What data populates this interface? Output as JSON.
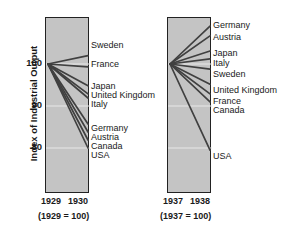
{
  "chart_data": {
    "type": "line",
    "title": "",
    "ylabel": "Index of Industrial Output",
    "xlabel": "",
    "ylim": [
      74,
      112
    ],
    "yticks": [
      100,
      90,
      80
    ],
    "ytick_labels": [
      "100",
      "90",
      "80"
    ],
    "grid": true,
    "legend": "inline-right-labels",
    "panels": [
      {
        "id": "left",
        "x": [
          "1929",
          "1930"
        ],
        "caption": "(1929 = 100)",
        "base_value": 100,
        "series": [
          {
            "name": "Sweden",
            "values": [
              100,
              102.0
            ]
          },
          {
            "name": "France",
            "values": [
              100,
              99.3
            ]
          },
          {
            "name": "Japan",
            "values": [
              100,
              94.8
            ]
          },
          {
            "name": "United Kingdom",
            "values": [
              100,
              92.9
            ]
          },
          {
            "name": "Italy",
            "values": [
              100,
              91.9
            ]
          },
          {
            "name": "Germany",
            "values": [
              100,
              85.7
            ]
          },
          {
            "name": "Austria",
            "values": [
              100,
              83.8
            ]
          },
          {
            "name": "Canada",
            "values": [
              100,
              81.9
            ]
          },
          {
            "name": "USA",
            "values": [
              100,
              80.0
            ]
          }
        ]
      },
      {
        "id": "right",
        "x": [
          "1937",
          "1938"
        ],
        "caption": "(1937 = 100)",
        "base_value": 100,
        "series": [
          {
            "name": "Germany",
            "values": [
              100,
              109.0
            ]
          },
          {
            "name": "Austria",
            "values": [
              100,
              106.7
            ]
          },
          {
            "name": "Japan",
            "values": [
              100,
              103.1
            ]
          },
          {
            "name": "Italy",
            "values": [
              100,
              101.2
            ]
          },
          {
            "name": "Sweden",
            "values": [
              100,
              98.8
            ]
          },
          {
            "name": "United Kingdom",
            "values": [
              100,
              95.2
            ]
          },
          {
            "name": "France",
            "values": [
              100,
              92.9
            ]
          },
          {
            "name": "Canada",
            "values": [
              100,
              91.0
            ]
          },
          {
            "name": "USA",
            "values": [
              100,
              79.5
            ]
          }
        ]
      }
    ]
  },
  "axis": {
    "ylabel": "Index of Industrial Output",
    "ytick_100": "100",
    "ytick_90": "90",
    "ytick_80": "80"
  },
  "left_panel": {
    "xtick_start": "1929",
    "xtick_end": "1930",
    "caption": "(1929 = 100)",
    "labels": [
      {
        "name": "Sweden",
        "y": 41
      },
      {
        "name": "France",
        "y": 60
      },
      {
        "name": "Japan",
        "y": 82
      },
      {
        "name": "United Kingdom",
        "y": 91
      },
      {
        "name": "Italy",
        "y": 100
      },
      {
        "name": "Germany",
        "y": 124
      },
      {
        "name": "Austria",
        "y": 133
      },
      {
        "name": "Canada",
        "y": 142
      },
      {
        "name": "USA",
        "y": 151
      }
    ]
  },
  "right_panel": {
    "xtick_start": "1937",
    "xtick_end": "1938",
    "caption": "(1937 = 100)",
    "labels": [
      {
        "name": "Germany",
        "y": 21
      },
      {
        "name": "Austria",
        "y": 33
      },
      {
        "name": "Japan",
        "y": 49
      },
      {
        "name": "Italy",
        "y": 59
      },
      {
        "name": "Sweden",
        "y": 70
      },
      {
        "name": "United Kingdom",
        "y": 86
      },
      {
        "name": "France",
        "y": 97
      },
      {
        "name": "Canada",
        "y": 106
      },
      {
        "name": "USA",
        "y": 152
      }
    ]
  },
  "colors": {
    "panel_fill": "#c4c4c4",
    "panel_border": "#222222",
    "line": "#404040",
    "gridline": "#e8e8e8",
    "text": "#1a1a1a",
    "background": "#ffffff"
  }
}
